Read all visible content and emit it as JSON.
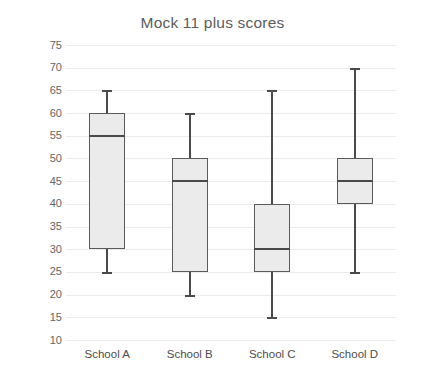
{
  "chart_data": {
    "type": "box",
    "title": "Mock 11 plus scores",
    "xlabel": "",
    "ylabel": "Test score %",
    "ylim": [
      10,
      75
    ],
    "ytick_step": 5,
    "yticks": [
      75,
      70,
      65,
      60,
      55,
      50,
      45,
      40,
      35,
      30,
      25,
      20,
      15,
      10
    ],
    "categories": [
      "School A",
      "School B",
      "School C",
      "School D"
    ],
    "grid": "horizontal",
    "legend": "none",
    "series": [
      {
        "name": "School A",
        "min": 25,
        "q1": 30,
        "median": 55,
        "q3": 60,
        "max": 65
      },
      {
        "name": "School B",
        "min": 20,
        "q1": 25,
        "median": 45,
        "q3": 50,
        "max": 60
      },
      {
        "name": "School C",
        "min": 15,
        "q1": 25,
        "median": 30,
        "q3": 40,
        "max": 65
      },
      {
        "name": "School D",
        "min": 25,
        "q1": 40,
        "median": 45,
        "q3": 50,
        "max": 70
      }
    ],
    "colors": {
      "box_fill": "#ebebeb",
      "box_border": "#5a5a5a",
      "median": "#4a4a4a",
      "whisker": "#4a4a4a",
      "gridline": "#ececed",
      "title_text": "#5c5c5c",
      "tick_text": "#646464",
      "background": "#ffffff"
    }
  }
}
